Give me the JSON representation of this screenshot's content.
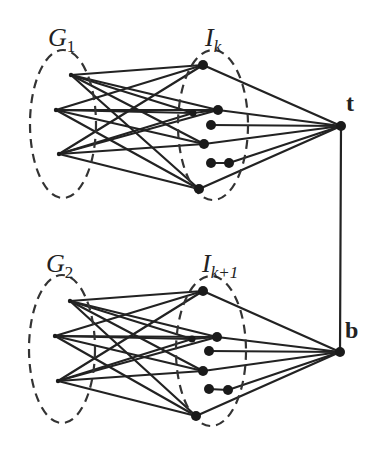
{
  "diagram": {
    "colors": {
      "ink": "#222222",
      "background": "#ffffff"
    },
    "labels": {
      "g1": {
        "base": "G",
        "sub": "1"
      },
      "ik": {
        "base": "I",
        "sub": "k"
      },
      "g2": {
        "base": "G",
        "sub": "2"
      },
      "ik1": {
        "base": "I",
        "sub": "k+1"
      },
      "t": "t",
      "b": "b"
    },
    "groups": [
      {
        "name": "upper",
        "g_ellipse": {
          "cx": 63,
          "cy": 124,
          "rx": 33,
          "ry": 74
        },
        "i_ellipse": {
          "cx": 213,
          "cy": 125,
          "rx": 35,
          "ry": 75
        },
        "g_nodes": [
          [
            71,
            75
          ],
          [
            56,
            110
          ],
          [
            59,
            154
          ]
        ],
        "i_nodes": [
          [
            203,
            65
          ],
          [
            193,
            113
          ],
          [
            218,
            110
          ],
          [
            211,
            125
          ],
          [
            204,
            144
          ],
          [
            211,
            163
          ],
          [
            229,
            163
          ],
          [
            199,
            189
          ]
        ],
        "hub": [
          341,
          126
        ]
      },
      {
        "name": "lower",
        "g_ellipse": {
          "cx": 62,
          "cy": 349,
          "rx": 33,
          "ry": 74
        },
        "i_ellipse": {
          "cx": 211,
          "cy": 351,
          "rx": 35,
          "ry": 75
        },
        "g_nodes": [
          [
            70,
            301
          ],
          [
            55,
            336
          ],
          [
            58,
            381
          ]
        ],
        "i_nodes": [
          [
            203,
            291
          ],
          [
            192,
            339
          ],
          [
            217,
            337
          ],
          [
            209,
            351
          ],
          [
            203,
            371
          ],
          [
            209,
            389
          ],
          [
            228,
            390
          ],
          [
            196,
            416
          ]
        ],
        "hub": [
          340,
          352
        ]
      }
    ],
    "vertical_edge": {
      "from": "t",
      "to": "b"
    }
  }
}
